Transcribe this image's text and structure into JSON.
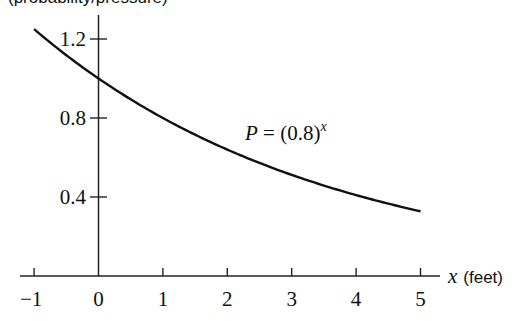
{
  "chart_data": {
    "type": "line",
    "title": "",
    "top_label_cropped": "(probability/pressure)",
    "xlabel": "x (feet)",
    "xlabel_var": "x",
    "xlabel_unit": "(feet)",
    "ylabel": "",
    "xlim": [
      -1,
      5
    ],
    "ylim": [
      0,
      1.25
    ],
    "x_ticks": [
      -1,
      0,
      1,
      2,
      3,
      4,
      5
    ],
    "x_tick_labels": [
      "−1",
      "0",
      "1",
      "2",
      "3",
      "4",
      "5"
    ],
    "y_ticks": [
      0.4,
      0.8,
      1.2
    ],
    "y_tick_labels": [
      "0.4",
      "0.8",
      "1.2"
    ],
    "grid": false,
    "legend": null,
    "series": [
      {
        "name": "P = (0.8)^x",
        "formula_base": 0.8,
        "x": [
          -1,
          0,
          1,
          2,
          3,
          4,
          5
        ],
        "values": [
          1.25,
          1.0,
          0.8,
          0.64,
          0.512,
          0.41,
          0.328
        ]
      }
    ],
    "annotations": [
      {
        "text_lhs": "P",
        "text_eq": " = (0.8)",
        "text_exp": "x",
        "x": 2.3,
        "y": 0.8
      }
    ]
  }
}
